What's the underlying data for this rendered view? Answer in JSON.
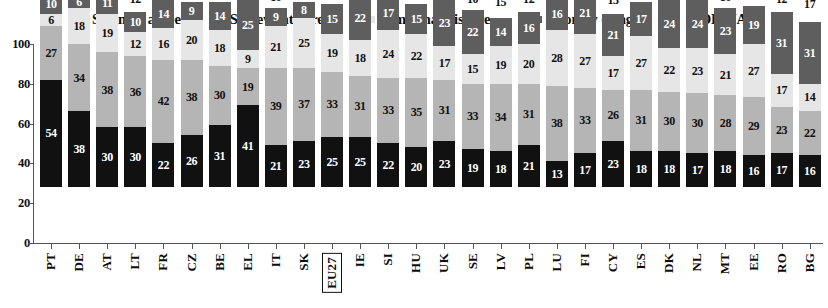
{
  "legend": {
    "position": "top-center",
    "items": [
      {
        "label": "Strongly agree",
        "swatch": "black",
        "color": "#111111"
      },
      {
        "label": "Somewhat agree",
        "swatch": "mid-gray",
        "color": "#b5b5b5"
      },
      {
        "label": "Somewhat disagree",
        "swatch": "light-gray",
        "color": "#e6e6e6"
      },
      {
        "label": "Strongly disagree",
        "swatch": "dark-gray",
        "color": "#5e5e5e"
      },
      {
        "label": "DK/NA",
        "swatch": "white",
        "color": "#ffffff"
      }
    ]
  },
  "axis": {
    "y_ticks": [
      "0",
      "20",
      "40",
      "60",
      "80",
      "100"
    ],
    "y_min": 0,
    "y_max": 100,
    "grid": false
  },
  "highlight_category": "EU27",
  "chart_data": {
    "type": "bar",
    "title": "",
    "subtitle": "",
    "xlabel": "",
    "ylabel": "",
    "ylim": [
      0,
      100
    ],
    "stacked": true,
    "orientation": "vertical",
    "grid": false,
    "legend_position": "top-center",
    "categories": [
      "PT",
      "DE",
      "AT",
      "LT",
      "FR",
      "CZ",
      "BE",
      "EL",
      "IT",
      "SK",
      "EU27",
      "IE",
      "SI",
      "HU",
      "UK",
      "SE",
      "LV",
      "PL",
      "LU",
      "FI",
      "CY",
      "ES",
      "DK",
      "NL",
      "MT",
      "EE",
      "RO",
      "BG"
    ],
    "series": [
      {
        "name": "Strongly agree",
        "color": "#111111",
        "values": [
          54,
          38,
          30,
          30,
          22,
          26,
          31,
          41,
          21,
          23,
          25,
          25,
          22,
          20,
          23,
          19,
          18,
          21,
          13,
          17,
          23,
          18,
          18,
          17,
          18,
          16,
          17,
          16
        ]
      },
      {
        "name": "Somewhat agree",
        "color": "#b5b5b5",
        "values": [
          27,
          34,
          38,
          36,
          42,
          38,
          30,
          19,
          39,
          37,
          33,
          31,
          33,
          35,
          31,
          33,
          34,
          31,
          38,
          33,
          26,
          31,
          30,
          30,
          28,
          29,
          23,
          22
        ]
      },
      {
        "name": "Somewhat disagree",
        "color": "#e6e6e6",
        "values": [
          6,
          18,
          19,
          12,
          16,
          20,
          18,
          9,
          21,
          25,
          19,
          18,
          24,
          22,
          17,
          15,
          19,
          20,
          28,
          27,
          17,
          27,
          22,
          23,
          21,
          27,
          17,
          14
        ]
      },
      {
        "name": "Strongly disagree",
        "color": "#5e5e5e",
        "values": [
          10,
          6,
          11,
          10,
          14,
          9,
          14,
          25,
          9,
          8,
          15,
          22,
          17,
          15,
          23,
          22,
          14,
          16,
          16,
          21,
          21,
          17,
          24,
          24,
          23,
          19,
          31,
          31
        ]
      },
      {
        "name": "DK/NA",
        "color": "#ffffff",
        "values": [
          3,
          4,
          3,
          12,
          6,
          6,
          8,
          6,
          10,
          7,
          7,
          4,
          4,
          9,
          6,
          10,
          15,
          12,
          5,
          4,
          13,
          7,
          5,
          7,
          10,
          9,
          12,
          17
        ]
      }
    ]
  }
}
